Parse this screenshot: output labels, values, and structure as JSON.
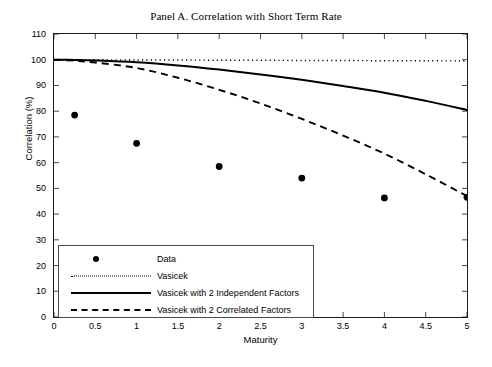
{
  "chart_data": {
    "type": "line",
    "title": "Panel A. Correlation with Short Term Rate",
    "xlabel": "Maturity",
    "ylabel": "Correlation (%)",
    "xlim": [
      0,
      5
    ],
    "ylim": [
      0,
      110
    ],
    "xticks": [
      "0",
      "0.5",
      "1",
      "1.5",
      "2",
      "2.5",
      "3",
      "3.5",
      "4",
      "4.5",
      "5"
    ],
    "xtick_values": [
      0,
      0.5,
      1,
      1.5,
      2,
      2.5,
      3,
      3.5,
      4,
      4.5,
      5
    ],
    "yticks": [
      "0",
      "10",
      "20",
      "30",
      "40",
      "50",
      "60",
      "70",
      "80",
      "90",
      "100",
      "110"
    ],
    "ytick_values": [
      0,
      10,
      20,
      30,
      40,
      50,
      60,
      70,
      80,
      90,
      100,
      110
    ],
    "grid": false,
    "legend_position": "lower left",
    "series": [
      {
        "name": "Data",
        "style": "marker",
        "marker": "filled-circle",
        "color": "#000000",
        "x": [
          0.25,
          1,
          2,
          3,
          4,
          5
        ],
        "values": [
          78.5,
          67.5,
          58.5,
          54.0,
          46.3,
          46.5
        ]
      },
      {
        "name": "Vasicek",
        "style": "dotted",
        "color": "#000000",
        "x": [
          0,
          0.25,
          0.5,
          1,
          1.5,
          2,
          2.5,
          3,
          3.5,
          4,
          4.5,
          5
        ],
        "values": [
          100,
          100,
          100,
          99.9,
          99.9,
          99.8,
          99.8,
          99.7,
          99.7,
          99.6,
          99.6,
          99.5
        ]
      },
      {
        "name": "Vasicek with 2 Independent Factors",
        "style": "solid",
        "color": "#000000",
        "x": [
          0,
          0.25,
          0.5,
          1,
          1.5,
          2,
          2.5,
          3,
          3.5,
          4,
          4.5,
          5
        ],
        "values": [
          100,
          99.9,
          99.7,
          99.0,
          97.8,
          96.2,
          94.3,
          92.2,
          89.8,
          87.2,
          84.0,
          80.5
        ]
      },
      {
        "name": "Vasicek with 2 Correlated Factors",
        "style": "dashed",
        "color": "#000000",
        "x": [
          0,
          0.25,
          0.5,
          1,
          1.5,
          2,
          2.5,
          3,
          3.5,
          4,
          4.5,
          5
        ],
        "values": [
          100,
          99.6,
          98.9,
          96.8,
          93.0,
          88.3,
          83.0,
          77.0,
          70.5,
          63.5,
          55.5,
          47.0
        ]
      }
    ]
  },
  "legend": {
    "items": [
      {
        "label": "Data",
        "key": "dot-marker"
      },
      {
        "label": "Vasicek",
        "key": "dotted-line"
      },
      {
        "label": "Vasicek with 2 Independent Factors",
        "key": "solid-line"
      },
      {
        "label": "Vasicek with 2 Correlated Factors",
        "key": "dashed-line"
      }
    ]
  }
}
